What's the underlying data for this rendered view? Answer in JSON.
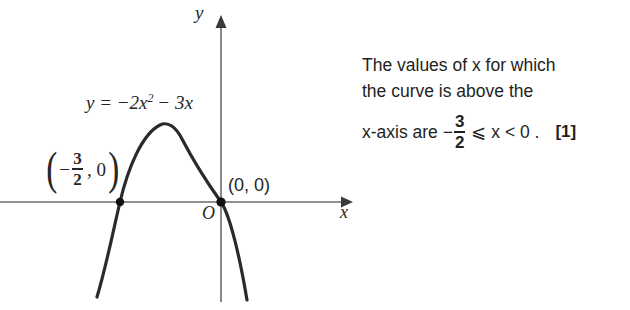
{
  "graph": {
    "equation_label": {
      "lhs": "y = −2x",
      "exponent": "2",
      "rhs": " − 3x"
    },
    "axis_label_x": "x",
    "axis_label_y": "y",
    "origin_label": "O",
    "point_origin_label": "(0, 0)",
    "point_root_label": {
      "open_paren": "(",
      "negative": "−",
      "numerator": "3",
      "denominator": "2",
      "comma_zero": ", 0",
      "close_paren": ")"
    },
    "curve": {
      "type": "parabola",
      "equation": "y = -2x^2 - 3x",
      "roots": [
        "-3/2",
        "0"
      ],
      "vertex_x": "-3/4",
      "opens": "downward"
    },
    "colors": {
      "curve": "#2a2a2a",
      "axis": "#6a6a6a",
      "point": "#111111",
      "text": "#262626"
    }
  },
  "answer": {
    "line1": "The values of x for which",
    "line2": "the curve is above the",
    "line3": {
      "prefix": "x-axis are −",
      "numerator": "3",
      "denominator": "2",
      "middle": "⩽ x < 0 .",
      "marks": "[1]"
    }
  }
}
